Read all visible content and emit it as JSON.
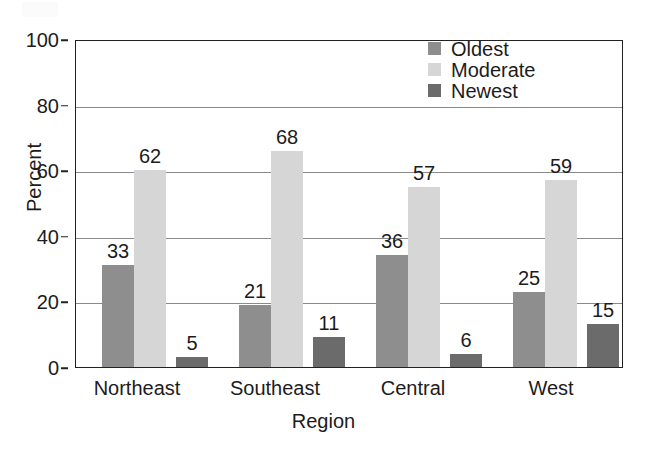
{
  "chart_data": {
    "type": "bar",
    "title": "",
    "subtitle": "",
    "xlabel": "Region",
    "ylabel": "Percent",
    "categories": [
      "Northeast",
      "Southeast",
      "Central",
      "West"
    ],
    "series": [
      {
        "name": "Oldest",
        "color": "#8e8e8e",
        "values": [
          33,
          21,
          36,
          25
        ]
      },
      {
        "name": "Moderate",
        "color": "#d6d6d6",
        "values": [
          62,
          68,
          57,
          59
        ]
      },
      {
        "name": "Newest",
        "color": "#6b6b6b",
        "values": [
          5,
          11,
          6,
          15
        ]
      }
    ],
    "ylim": [
      0,
      100
    ],
    "yticks": [
      0,
      20,
      40,
      60,
      80,
      100
    ],
    "ytick_labels": [
      "0",
      "20",
      "40",
      "60",
      "80",
      "100"
    ],
    "grid": "horizontal",
    "data_labels": true,
    "legend_position": "top-right",
    "legend_entries": [
      "Oldest",
      "Moderate",
      "Newest"
    ],
    "axis_color": "#222222",
    "grid_color": "#8a8a8a",
    "background": "#ffffff"
  }
}
